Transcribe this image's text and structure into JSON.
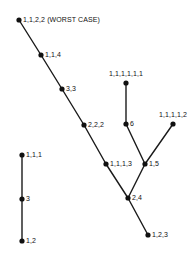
{
  "figure": {
    "type": "node-link-diagram",
    "width": 191,
    "height": 255,
    "background_color": "#ffffff",
    "node_color": "#111111",
    "edge_color": "#1a1a1a",
    "nodes": [
      {
        "id": "n1",
        "label": "1,1,2,2 (WORST CASE)",
        "x": 19,
        "y": 20,
        "label_pos": "right"
      },
      {
        "id": "n2",
        "label": "1,1,4",
        "x": 41,
        "y": 55,
        "label_pos": "right"
      },
      {
        "id": "n3",
        "label": "3,3",
        "x": 62,
        "y": 89,
        "label_pos": "right"
      },
      {
        "id": "n4",
        "label": "2,2,2",
        "x": 84,
        "y": 125,
        "label_pos": "right"
      },
      {
        "id": "n5",
        "label": "1,1,1,3",
        "x": 106,
        "y": 164,
        "label_pos": "right"
      },
      {
        "id": "n6",
        "label": "2,4",
        "x": 128,
        "y": 198,
        "label_pos": "right"
      },
      {
        "id": "n7",
        "label": "1,2,3",
        "x": 148,
        "y": 235,
        "label_pos": "right"
      },
      {
        "id": "n8",
        "label": "1,5",
        "x": 145,
        "y": 164,
        "label_pos": "right"
      },
      {
        "id": "n9",
        "label": "6",
        "x": 126,
        "y": 124,
        "label_pos": "right"
      },
      {
        "id": "n10",
        "label": "1,1,1,1,1,1",
        "x": 126,
        "y": 83,
        "label_pos": "above"
      },
      {
        "id": "n11",
        "label": "1,1,1,1,2",
        "x": 173,
        "y": 124,
        "label_pos": "above"
      },
      {
        "id": "n12",
        "label": "1,1,1",
        "x": 22,
        "y": 155,
        "label_pos": "right"
      },
      {
        "id": "n13",
        "label": "3",
        "x": 22,
        "y": 199,
        "label_pos": "right"
      },
      {
        "id": "n14",
        "label": "1,2",
        "x": 22,
        "y": 241,
        "label_pos": "right"
      }
    ],
    "edges": [
      {
        "from": "n1",
        "to": "n2"
      },
      {
        "from": "n2",
        "to": "n3"
      },
      {
        "from": "n3",
        "to": "n4"
      },
      {
        "from": "n4",
        "to": "n5"
      },
      {
        "from": "n5",
        "to": "n6"
      },
      {
        "from": "n6",
        "to": "n7"
      },
      {
        "from": "n6",
        "to": "n8"
      },
      {
        "from": "n8",
        "to": "n9"
      },
      {
        "from": "n9",
        "to": "n10"
      },
      {
        "from": "n8",
        "to": "n11"
      },
      {
        "from": "n12",
        "to": "n13"
      },
      {
        "from": "n13",
        "to": "n14"
      }
    ]
  }
}
